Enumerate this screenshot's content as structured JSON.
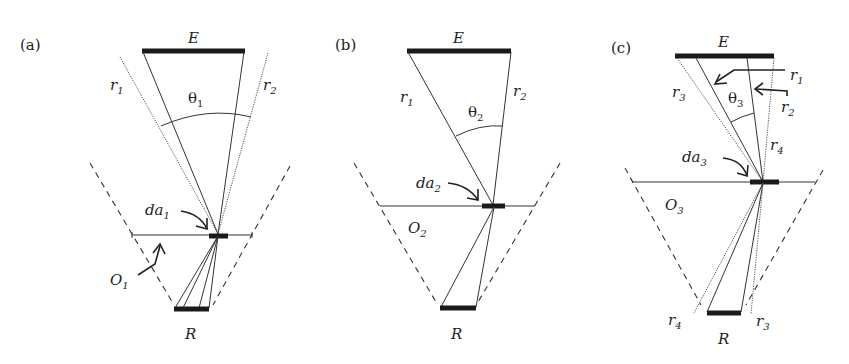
{
  "figure": {
    "panels": [
      {
        "id": "a",
        "tag": "(a)",
        "emitter": "E",
        "receiver": "R",
        "angle": {
          "sym": "θ",
          "sub": "1"
        },
        "area": {
          "sym": "da",
          "sub": "1"
        },
        "plane": {
          "sym": "O",
          "sub": "1"
        },
        "rays": [
          {
            "sym": "r",
            "sub": "1"
          },
          {
            "sym": "r",
            "sub": "2"
          }
        ]
      },
      {
        "id": "b",
        "tag": "(b)",
        "emitter": "E",
        "receiver": "R",
        "angle": {
          "sym": "θ",
          "sub": "2"
        },
        "area": {
          "sym": "da",
          "sub": "2"
        },
        "plane": {
          "sym": "O",
          "sub": "2"
        },
        "rays": [
          {
            "sym": "r",
            "sub": "1"
          },
          {
            "sym": "r",
            "sub": "2"
          }
        ]
      },
      {
        "id": "c",
        "tag": "(c)",
        "emitter": "E",
        "receiver": "R",
        "angle": {
          "sym": "θ",
          "sub": "3"
        },
        "area": {
          "sym": "da",
          "sub": "3"
        },
        "plane": {
          "sym": "O",
          "sub": "3"
        },
        "rays": [
          {
            "sym": "r",
            "sub": "1"
          },
          {
            "sym": "r",
            "sub": "2"
          },
          {
            "sym": "r",
            "sub": "3"
          },
          {
            "sym": "r",
            "sub": "4"
          },
          {
            "sym": "r",
            "sub": "3"
          },
          {
            "sym": "r",
            "sub": "4"
          }
        ]
      }
    ],
    "colors": {
      "ink": "#1a1a1a",
      "background": "#ffffff"
    }
  }
}
